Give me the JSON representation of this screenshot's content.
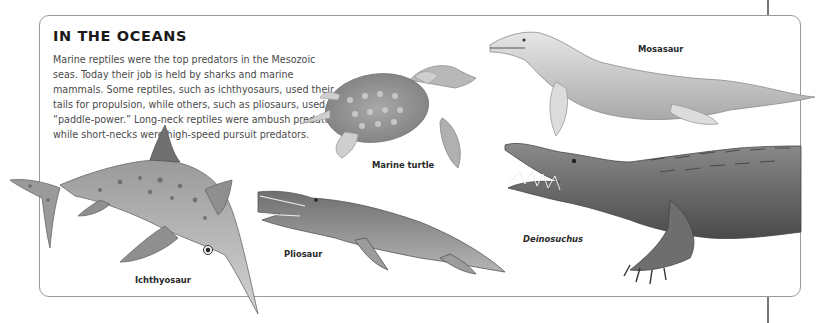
{
  "section": {
    "title": "IN THE OCEANS",
    "intro": "Marine reptiles were the top predators in the Mesozoic seas. Today their job is held by sharks and marine mammals. Some reptiles, such as ichthyosaurs, used their tails for propulsion, while others, such as pliosaurs, used “paddle-power.” Long-neck reptiles were ambush predators while short-necks were high-speed pursuit predators."
  },
  "illustrations": [
    {
      "id": "mosasaur",
      "label": "Mosasaur",
      "italic": false
    },
    {
      "id": "marine-turtle",
      "label": "Marine turtle",
      "italic": false
    },
    {
      "id": "ichthyosaur",
      "label": "Ichthyosaur",
      "italic": false
    },
    {
      "id": "pliosaur",
      "label": "Pliosaur",
      "italic": false
    },
    {
      "id": "deinosuchus",
      "label": "Deinosuchus",
      "italic": true
    }
  ],
  "colors": {
    "frame": "#9a9a9a",
    "title": "#1a1a1a",
    "body_text": "#4a4a4a"
  }
}
